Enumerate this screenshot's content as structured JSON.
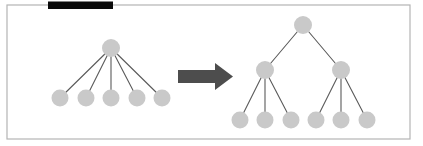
{
  "figure": {
    "name": "flat-tree-to-balanced-tree-transformation",
    "background_color": "#ffffff"
  },
  "frame": {
    "name": "figure-border",
    "x": 7,
    "y": 5,
    "width": 403,
    "height": 134,
    "stroke_color": "#b4b4b4",
    "stroke_width": 1.2,
    "fill": "none"
  },
  "redaction_bar": {
    "name": "black-bar",
    "x": 48,
    "y": 1.5,
    "width": 65,
    "height": 7.5,
    "color": "#0a0a0a"
  },
  "style": {
    "node_fill": "#c9c9c9",
    "node_stroke": "none",
    "edge_color": "#5a5a5a",
    "edge_width": 1.1,
    "arrow_color": "#4d4d4d"
  },
  "arrow": {
    "name": "transformation-arrow",
    "direction": "right",
    "color": "#4d4d4d",
    "points": "178,70 215,70 215,63 233,76.5 215,90 215,83 178,83",
    "label": ""
  },
  "left_tree": {
    "name": "flat-star-tree",
    "label": "",
    "node_radius": 8.5,
    "nodes": [
      {
        "id": "L-root",
        "name": "left-tree-root-node",
        "cx": 111,
        "cy": 48,
        "r": 9,
        "level": 0
      },
      {
        "id": "L-1",
        "name": "left-tree-leaf-node-1",
        "cx": 60,
        "cy": 98,
        "r": 8.5,
        "level": 1
      },
      {
        "id": "L-2",
        "name": "left-tree-leaf-node-2",
        "cx": 86,
        "cy": 98,
        "r": 8.5,
        "level": 1
      },
      {
        "id": "L-3",
        "name": "left-tree-leaf-node-3",
        "cx": 111,
        "cy": 98,
        "r": 8.5,
        "level": 1
      },
      {
        "id": "L-4",
        "name": "left-tree-leaf-node-4",
        "cx": 137,
        "cy": 98,
        "r": 8.5,
        "level": 1
      },
      {
        "id": "L-5",
        "name": "left-tree-leaf-node-5",
        "cx": 162,
        "cy": 98,
        "r": 8.5,
        "level": 1
      }
    ],
    "edges": [
      {
        "name": "left-tree-edge-root-1",
        "x1": 111,
        "y1": 48,
        "x2": 60,
        "y2": 98
      },
      {
        "name": "left-tree-edge-root-2",
        "x1": 111,
        "y1": 48,
        "x2": 86,
        "y2": 98
      },
      {
        "name": "left-tree-edge-root-3",
        "x1": 111,
        "y1": 48,
        "x2": 111,
        "y2": 98
      },
      {
        "name": "left-tree-edge-root-4",
        "x1": 111,
        "y1": 48,
        "x2": 137,
        "y2": 98
      },
      {
        "name": "left-tree-edge-root-5",
        "x1": 111,
        "y1": 48,
        "x2": 162,
        "y2": 98
      }
    ]
  },
  "right_tree": {
    "name": "balanced-tree",
    "label": "",
    "node_radius": 8.5,
    "nodes": [
      {
        "id": "R-root",
        "name": "right-tree-root-node",
        "cx": 303,
        "cy": 25,
        "r": 9,
        "level": 0
      },
      {
        "id": "R-A",
        "name": "right-tree-internal-node-left",
        "cx": 265,
        "cy": 70,
        "r": 9,
        "level": 1
      },
      {
        "id": "R-B",
        "name": "right-tree-internal-node-right",
        "cx": 341,
        "cy": 70,
        "r": 9,
        "level": 1
      },
      {
        "id": "R-1",
        "name": "right-tree-leaf-node-1",
        "cx": 240,
        "cy": 120,
        "r": 8.5,
        "level": 2
      },
      {
        "id": "R-2",
        "name": "right-tree-leaf-node-2",
        "cx": 265,
        "cy": 120,
        "r": 8.5,
        "level": 2
      },
      {
        "id": "R-3",
        "name": "right-tree-leaf-node-3",
        "cx": 291,
        "cy": 120,
        "r": 8.5,
        "level": 2
      },
      {
        "id": "R-4",
        "name": "right-tree-leaf-node-4",
        "cx": 316,
        "cy": 120,
        "r": 8.5,
        "level": 2
      },
      {
        "id": "R-5",
        "name": "right-tree-leaf-node-5",
        "cx": 341,
        "cy": 120,
        "r": 8.5,
        "level": 2
      },
      {
        "id": "R-6",
        "name": "right-tree-leaf-node-6",
        "cx": 367,
        "cy": 120,
        "r": 8.5,
        "level": 2
      }
    ],
    "edges": [
      {
        "name": "right-tree-edge-root-left",
        "x1": 303,
        "y1": 25,
        "x2": 265,
        "y2": 70
      },
      {
        "name": "right-tree-edge-root-right",
        "x1": 303,
        "y1": 25,
        "x2": 341,
        "y2": 70
      },
      {
        "name": "right-tree-edge-left-1",
        "x1": 265,
        "y1": 70,
        "x2": 240,
        "y2": 120
      },
      {
        "name": "right-tree-edge-left-2",
        "x1": 265,
        "y1": 70,
        "x2": 265,
        "y2": 120
      },
      {
        "name": "right-tree-edge-left-3",
        "x1": 265,
        "y1": 70,
        "x2": 291,
        "y2": 120
      },
      {
        "name": "right-tree-edge-right-4",
        "x1": 341,
        "y1": 70,
        "x2": 316,
        "y2": 120
      },
      {
        "name": "right-tree-edge-right-5",
        "x1": 341,
        "y1": 70,
        "x2": 341,
        "y2": 120
      },
      {
        "name": "right-tree-edge-right-6",
        "x1": 341,
        "y1": 70,
        "x2": 367,
        "y2": 120
      }
    ]
  }
}
